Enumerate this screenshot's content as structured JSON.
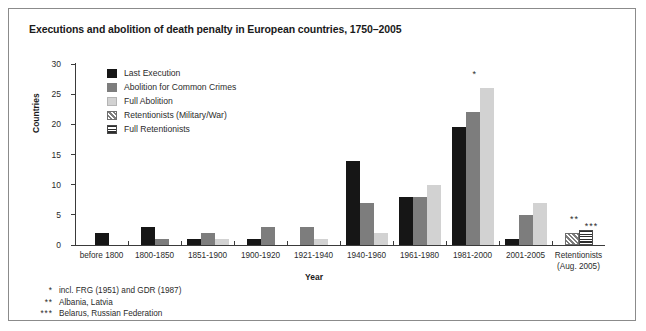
{
  "chart_data": {
    "type": "bar",
    "title": "Executions and abolition of death penalty in European countries, 1750–2005",
    "xlabel": "Year",
    "ylabel": "Countries",
    "ylim": [
      0,
      30
    ],
    "yticks": [
      0,
      5,
      10,
      15,
      20,
      25,
      30
    ],
    "grid": false,
    "legend_position": "top-left inside plot",
    "categories": [
      "before 1800",
      "1800-1850",
      "1851-1900",
      "1900-1920",
      "1921-1940",
      "1940-1960",
      "1961-1980",
      "1981-2000",
      "2001-2005",
      "Retentionists\n(Aug. 2005)"
    ],
    "series": [
      {
        "name": "Last Execution",
        "color": "#161616",
        "values": [
          2,
          3,
          1,
          1,
          0,
          14,
          8,
          19.5,
          1,
          0
        ]
      },
      {
        "name": "Abolition for Common Crimes",
        "color": "#7d7d7d",
        "values": [
          0,
          1,
          2,
          3,
          3,
          7,
          8,
          22,
          5,
          0
        ]
      },
      {
        "name": "Full Abolition",
        "color": "#d2d2d2",
        "values": [
          0,
          0,
          1,
          0,
          1,
          2,
          10,
          26,
          7,
          0
        ]
      },
      {
        "name": "Retentionists (Military/War)",
        "color": "#7d7d7d-hatch",
        "values": [
          0,
          0,
          0,
          0,
          0,
          0,
          0,
          0,
          0,
          2
        ]
      },
      {
        "name": "Full Retentionists",
        "color": "#2d2d2d-stripe",
        "values": [
          0,
          0,
          0,
          0,
          0,
          0,
          0,
          0,
          0,
          2.5
        ]
      }
    ],
    "annotations": [
      {
        "text": "*",
        "category": "1981-2000",
        "note": "incl. FRG (1951) and GDR (1987)"
      },
      {
        "text": "**",
        "category": "Retentionists (Aug. 2005)",
        "note": "Albania, Latvia"
      },
      {
        "text": "***",
        "category": "Retentionists (Aug. 2005)",
        "note": "Belarus, Russian Federation"
      }
    ]
  },
  "legend": {
    "items": [
      {
        "label": "Last Execution"
      },
      {
        "label": "Abolition for Common Crimes"
      },
      {
        "label": "Full Abolition"
      },
      {
        "label": "Retentionists (Military/War)"
      },
      {
        "label": "Full Retentionists"
      }
    ]
  },
  "axis": {
    "y_ticks": [
      "30",
      "25",
      "20",
      "15",
      "10",
      "5",
      "0"
    ],
    "y_title": "Countries",
    "x_title": "Year"
  },
  "footnotes": [
    {
      "mark": "*",
      "text": "incl. FRG (1951) and GDR (1987)"
    },
    {
      "mark": "**",
      "text": "Albania, Latvia"
    },
    {
      "mark": "***",
      "text": "Belarus, Russian Federation"
    }
  ],
  "bar_notes": [
    {
      "text": "*"
    },
    {
      "text": "**"
    },
    {
      "text": "***"
    }
  ]
}
